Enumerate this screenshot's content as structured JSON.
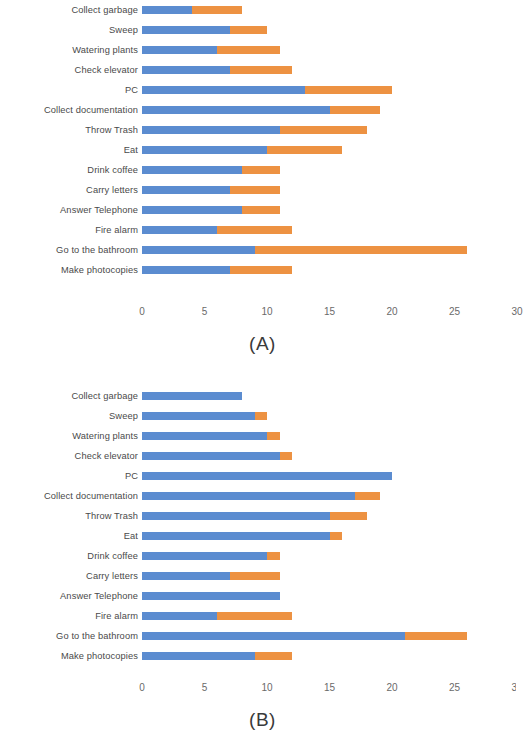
{
  "figure": {
    "panels": [
      {
        "key": "A",
        "caption": "(A)"
      },
      {
        "key": "B",
        "caption": "(B)"
      }
    ],
    "colors": {
      "series1": "#5b8cd0",
      "series2": "#ed9242"
    },
    "axis_ticks": [
      "0",
      "5",
      "10",
      "15",
      "20",
      "25",
      "30"
    ]
  },
  "chart_data": [
    {
      "type": "bar",
      "title": "(A)",
      "subtitle": "",
      "orientation": "horizontal",
      "stacked": true,
      "xlabel": "",
      "ylabel": "",
      "xlim": [
        0,
        30
      ],
      "xticks": [
        0,
        5,
        10,
        15,
        20,
        25,
        30
      ],
      "grid": false,
      "legend": null,
      "categories": [
        "Collect garbage",
        "Sweep",
        "Watering plants",
        "Check elevator",
        "PC",
        "Collect documentation",
        "Throw Trash",
        "Eat",
        "Drink coffee",
        "Carry letters",
        "Answer Telephone",
        "Fire alarm",
        "Go to the bathroom",
        "Make photocopies"
      ],
      "series": [
        {
          "name": "series1",
          "color": "#5b8cd0",
          "values": [
            4,
            7,
            6,
            7,
            13,
            15,
            11,
            10,
            8,
            7,
            8,
            6,
            9,
            7
          ]
        },
        {
          "name": "series2",
          "color": "#ed9242",
          "values": [
            4,
            3,
            5,
            5,
            7,
            4,
            7,
            6,
            3,
            4,
            3,
            6,
            17,
            5
          ]
        }
      ],
      "totals": [
        8,
        10,
        11,
        12,
        20,
        19,
        18,
        16,
        11,
        11,
        11,
        12,
        26,
        12
      ]
    },
    {
      "type": "bar",
      "title": "(B)",
      "subtitle": "",
      "orientation": "horizontal",
      "stacked": true,
      "xlabel": "",
      "ylabel": "",
      "xlim": [
        0,
        30
      ],
      "xticks": [
        0,
        5,
        10,
        15,
        20,
        25,
        30
      ],
      "grid": false,
      "legend": null,
      "categories": [
        "Collect garbage",
        "Sweep",
        "Watering plants",
        "Check elevator",
        "PC",
        "Collect documentation",
        "Throw Trash",
        "Eat",
        "Drink coffee",
        "Carry letters",
        "Answer Telephone",
        "Fire alarm",
        "Go to the bathroom",
        "Make photocopies"
      ],
      "series": [
        {
          "name": "series1",
          "color": "#5b8cd0",
          "values": [
            8,
            9,
            10,
            11,
            20,
            17,
            15,
            15,
            10,
            7,
            11,
            6,
            21,
            9
          ]
        },
        {
          "name": "series2",
          "color": "#ed9242",
          "values": [
            0,
            1,
            1,
            1,
            0,
            2,
            3,
            1,
            1,
            4,
            0,
            6,
            5,
            3
          ]
        }
      ],
      "totals": [
        8,
        10,
        11,
        12,
        20,
        19,
        18,
        16,
        11,
        11,
        11,
        12,
        26,
        12
      ]
    }
  ]
}
